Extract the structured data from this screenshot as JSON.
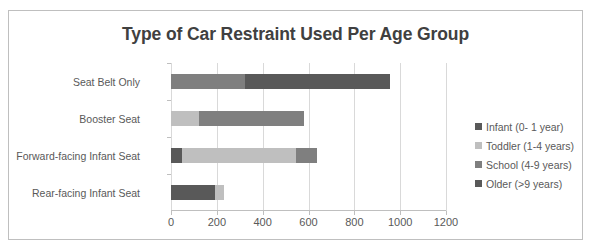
{
  "chart_data": {
    "type": "bar",
    "orientation": "horizontal",
    "stacked": true,
    "title": "Type of Car Restraint Used Per Age Group",
    "xlabel": "",
    "ylabel": "",
    "xlim": [
      0,
      1200
    ],
    "xticks": [
      0,
      200,
      400,
      600,
      800,
      1000,
      1200
    ],
    "xtick_labels": [
      "0",
      "200",
      "400",
      "600",
      "800",
      "1000",
      "1200"
    ],
    "grid": true,
    "grid_axis": "x",
    "legend_position": "right",
    "categories": [
      "Rear-facing Infant Seat",
      "Forward-facing Infant Seat",
      "Booster Seat",
      "Seat Belt Only"
    ],
    "series": [
      {
        "name": "Infant (0- 1 year)",
        "color": "#595959",
        "values": [
          190,
          50,
          0,
          0
        ]
      },
      {
        "name": "Toddler (1-4 years)",
        "color": "#bfbfbf",
        "values": [
          40,
          495,
          120,
          0
        ]
      },
      {
        "name": "School (4-9 years)",
        "color": "#7f7f7f",
        "values": [
          0,
          90,
          460,
          325
        ]
      },
      {
        "name": "Older (>9 years)",
        "color": "#595959",
        "values": [
          0,
          0,
          0,
          630
        ]
      }
    ],
    "totals": [
      230,
      635,
      580,
      955
    ]
  },
  "colors": {
    "frame_border": "#bfbfbf",
    "gridline": "#d9d9d9",
    "title_text": "#404040",
    "label_text": "#595959",
    "background": "#ffffff"
  }
}
